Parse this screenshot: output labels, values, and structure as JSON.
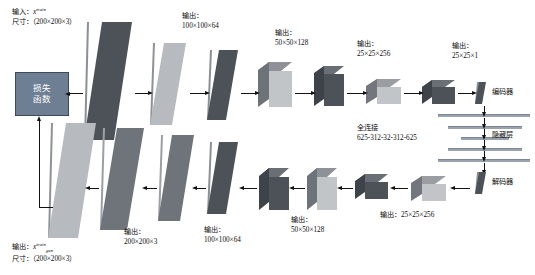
{
  "diagram": {
    "type": "neural-network-architecture",
    "colors": {
      "loss_box_fill": "#6f7f93",
      "dark_slab": "#4a4f55",
      "mid_slab": "#6b7078",
      "light_slab": "#b9bcc0",
      "arrow": "#111111",
      "fc_bar": "#9aa3ad",
      "background": "#ffffff"
    }
  },
  "loss": {
    "line1": "损失",
    "line2": "函数"
  },
  "input_label": {
    "prefix": "输入：",
    "var": "x",
    "sup": "train",
    "size_prefix": "尺寸：",
    "size_value": "（200×200×3）"
  },
  "output_label": {
    "prefix": "输出：",
    "var": "x",
    "sup": "train",
    "sub": "gen",
    "size_prefix": "尺寸：",
    "size_value": "（200×200×3）"
  },
  "encoder_labels": [
    {
      "prefix": "输出：",
      "value": "100×100×64"
    },
    {
      "prefix": "输出：",
      "value": "50×50×128"
    },
    {
      "prefix": "输出：",
      "value": "25×25×256"
    },
    {
      "prefix": "输出：",
      "value": "25×25×1"
    }
  ],
  "decoder_labels": [
    {
      "prefix": "输出：",
      "value": "200×200×3"
    },
    {
      "prefix": "输出：",
      "value": "100×100×64"
    },
    {
      "prefix": "输出：",
      "value": "50×50×128"
    },
    {
      "inline": "输出：25×25×256"
    }
  ],
  "bottleneck": {
    "fc_title": "全连接",
    "fc_dims": "625-312-32-312-625",
    "encoder_tag": "编码器",
    "hidden_tag": "隐藏层",
    "decoder_tag": "解码器"
  }
}
